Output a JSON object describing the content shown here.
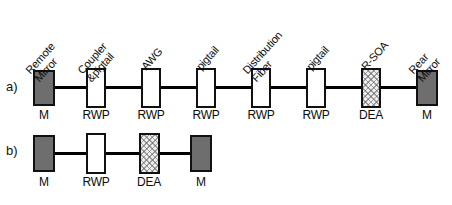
{
  "figure": {
    "width": 452,
    "height": 205,
    "background": "#ffffff",
    "line_color": "#000000",
    "fill_mirror": "#6e6e6e",
    "fill_rwp": "#ffffff",
    "fill_dea": "#eeeeee"
  },
  "panels": [
    {
      "id": "a",
      "letter": "a)",
      "components": [
        {
          "top_label_line1": "Remote",
          "top_label_line2": "Mirror",
          "under_label": "M",
          "fill": "mirror"
        },
        {
          "top_label_line1": "Coupler",
          "top_label_line2": "&pigtail",
          "under_label": "RWP",
          "fill": "rwp"
        },
        {
          "top_label_line1": "AWG",
          "top_label_line2": "",
          "under_label": "RWP",
          "fill": "rwp"
        },
        {
          "top_label_line1": "pigtail",
          "top_label_line2": "",
          "under_label": "RWP",
          "fill": "rwp"
        },
        {
          "top_label_line1": "Distribution",
          "top_label_line2": "Fiber",
          "under_label": "RWP",
          "fill": "rwp"
        },
        {
          "top_label_line1": "pigtail",
          "top_label_line2": "",
          "under_label": "RWP",
          "fill": "rwp"
        },
        {
          "top_label_line1": "R-SOA",
          "top_label_line2": "",
          "under_label": "DEA",
          "fill": "dea"
        },
        {
          "top_label_line1": "Rear",
          "top_label_line2": "Mirror",
          "under_label": "M",
          "fill": "mirror"
        }
      ]
    },
    {
      "id": "b",
      "letter": "b)",
      "components": [
        {
          "top_label_line1": "",
          "top_label_line2": "",
          "under_label": "M",
          "fill": "mirror"
        },
        {
          "top_label_line1": "",
          "top_label_line2": "",
          "under_label": "RWP",
          "fill": "rwp"
        },
        {
          "top_label_line1": "",
          "top_label_line2": "",
          "under_label": "DEA",
          "fill": "dea"
        },
        {
          "top_label_line1": "",
          "top_label_line2": "",
          "under_label": "M",
          "fill": "mirror"
        }
      ]
    }
  ]
}
